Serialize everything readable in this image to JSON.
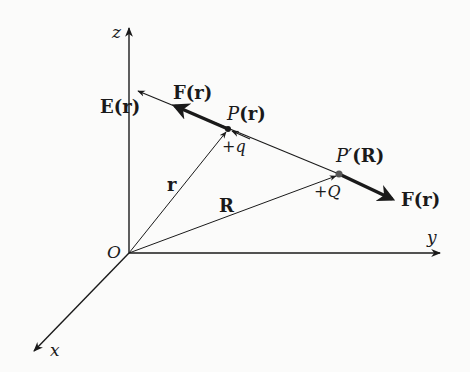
{
  "figure": {
    "type": "3D coordinate diagram of Coulomb force between two charges",
    "axes": {
      "z_label": "z",
      "y_label": "y",
      "x_label": "x",
      "origin_label": "O"
    },
    "points": {
      "p": {
        "label_main": "P",
        "label_arg": "(r)",
        "charge": "+q"
      },
      "p_prime": {
        "label_main": "P′",
        "label_arg": "(R)",
        "charge": "+Q"
      }
    },
    "vectors": {
      "r_label": "r",
      "R_label": "R",
      "field_label": "E(r)",
      "force_on_q_label": "F(r)",
      "force_on_Q_label": "F(r)"
    },
    "colors": {
      "ink": "#1a1a1a",
      "background": "#fbfbfa"
    }
  }
}
